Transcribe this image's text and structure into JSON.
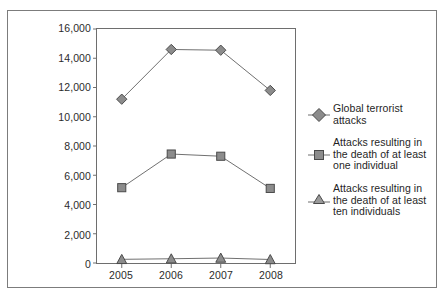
{
  "chart_data": {
    "type": "line",
    "title": "",
    "subtitle": "",
    "xlabel": "",
    "ylabel": "",
    "categories": [
      "2005",
      "2006",
      "2007",
      "2008"
    ],
    "ylim": [
      0,
      16000
    ],
    "ytick_step": 2000,
    "ytick_labels": [
      "16,000",
      "14,000",
      "12,000",
      "10,000",
      "8,000",
      "6,000",
      "4,000",
      "2,000",
      "0"
    ],
    "ytick_values": [
      16000,
      14000,
      12000,
      10000,
      8000,
      6000,
      4000,
      2000,
      0
    ],
    "grid": false,
    "legend_position": "right",
    "series": [
      {
        "name": "Global terrorist attacks",
        "marker": "diamond",
        "values": [
          11200,
          14600,
          14550,
          11800
        ]
      },
      {
        "name": "Attacks resulting in the death of at least one individual",
        "marker": "square",
        "values": [
          5150,
          7450,
          7300,
          5100
        ]
      },
      {
        "name": "Attacks resulting in the death of at least ten individuals",
        "marker": "triangle",
        "values": [
          250,
          290,
          340,
          240
        ]
      }
    ]
  },
  "legend": {
    "entries": [
      {
        "label_line1": "Global terrorist",
        "label_line2": "attacks",
        "label_line3": "",
        "marker": "diamond-marker-icon"
      },
      {
        "label_line1": "Attacks resulting in",
        "label_line2": "the death of at least",
        "label_line3": "one individual",
        "marker": "square-marker-icon"
      },
      {
        "label_line1": "Attacks resulting in",
        "label_line2": "the death of at least",
        "label_line3": "ten individuals",
        "marker": "triangle-marker-icon"
      }
    ]
  },
  "colors": {
    "marker_fill": "#8c8c8c",
    "marker_stroke": "#4a4a4a",
    "line": "#6e6e6e",
    "axis": "#6e6e6e",
    "border": "#7c7c7c",
    "text": "#1f1f1f"
  }
}
